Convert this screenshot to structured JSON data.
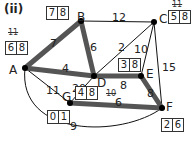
{
  "title": "(ii)",
  "nodes": [
    {
      "id": "A",
      "x": 25,
      "y": 68,
      "lx": 9,
      "ly": 64,
      "box": [
        "6",
        "8"
      ],
      "bx": 5,
      "by": 41,
      "crossed": "11",
      "cx": 8,
      "cy": 28
    },
    {
      "id": "B",
      "x": 81,
      "y": 21,
      "lx": 77,
      "ly": 11,
      "box": [
        "7",
        "8"
      ],
      "bx": 46,
      "by": 6,
      "crossed": "",
      "cx": 0,
      "cy": 0
    },
    {
      "id": "C",
      "x": 154,
      "y": 22,
      "lx": 159,
      "ly": 13,
      "box": [
        "5",
        "8"
      ],
      "bx": 168,
      "by": 10,
      "crossed": "11",
      "cx": 172,
      "cy": 0
    },
    {
      "id": "D",
      "x": 94,
      "y": 76,
      "lx": 97,
      "ly": 77,
      "box": [
        "4",
        "8"
      ],
      "bx": 75,
      "by": 86,
      "crossed": "10",
      "cx": 106,
      "cy": 89
    },
    {
      "id": "E",
      "x": 141,
      "y": 76,
      "lx": 146,
      "ly": 68,
      "box": [
        "3",
        "8"
      ],
      "bx": 118,
      "by": 58,
      "crossed": "",
      "cx": 0,
      "cy": 0
    },
    {
      "id": "F",
      "x": 162,
      "y": 108,
      "lx": 166,
      "ly": 101,
      "box": [
        "2",
        "6"
      ],
      "bx": 161,
      "by": 118,
      "crossed": "",
      "cx": 0,
      "cy": 0
    },
    {
      "id": "G",
      "x": 70,
      "y": 103,
      "lx": 62,
      "ly": 91,
      "box": [
        "0",
        "1"
      ],
      "bx": 47,
      "by": 110,
      "crossed": "",
      "cx": 0,
      "cy": 0
    }
  ],
  "edges": [
    {
      "from": "A",
      "to": "B",
      "weight": "7",
      "thick": true,
      "lx": 50,
      "ly": 38
    },
    {
      "from": "B",
      "to": "C",
      "weight": "12",
      "thick": false,
      "lx": 112,
      "ly": 12
    },
    {
      "from": "B",
      "to": "D",
      "weight": "6",
      "thick": true,
      "lx": 90,
      "ly": 42
    },
    {
      "from": "A",
      "to": "D",
      "weight": "4",
      "thick": true,
      "lx": 62,
      "ly": 63
    },
    {
      "from": "C",
      "to": "D",
      "weight": "2",
      "thick": false,
      "lx": 118,
      "ly": 42
    },
    {
      "from": "C",
      "to": "E",
      "weight": "10",
      "thick": false,
      "lx": 134,
      "ly": 44
    },
    {
      "from": "C",
      "to": "F",
      "weight": "15",
      "thick": false,
      "lx": 162,
      "ly": 62
    },
    {
      "from": "D",
      "to": "E",
      "weight": "8",
      "thick": true,
      "lx": 120,
      "ly": 80
    },
    {
      "from": "E",
      "to": "F",
      "weight": "8",
      "thick": true,
      "lx": 147,
      "ly": 88
    },
    {
      "from": "D",
      "to": "G",
      "weight": "20",
      "thick": false,
      "lx": 72,
      "ly": 83
    },
    {
      "from": "A",
      "to": "G",
      "weight": "11",
      "thick": false,
      "lx": 46,
      "ly": 85
    },
    {
      "from": "G",
      "to": "F",
      "weight": "6",
      "thick": true,
      "lx": 115,
      "ly": 97
    },
    {
      "from": "A",
      "to": "F",
      "weight": "9",
      "thick": false,
      "lx": 70,
      "ly": 121,
      "curve": true
    }
  ],
  "colors": {
    "thick": "#555555",
    "thin": "#111111",
    "node": "#000000"
  }
}
